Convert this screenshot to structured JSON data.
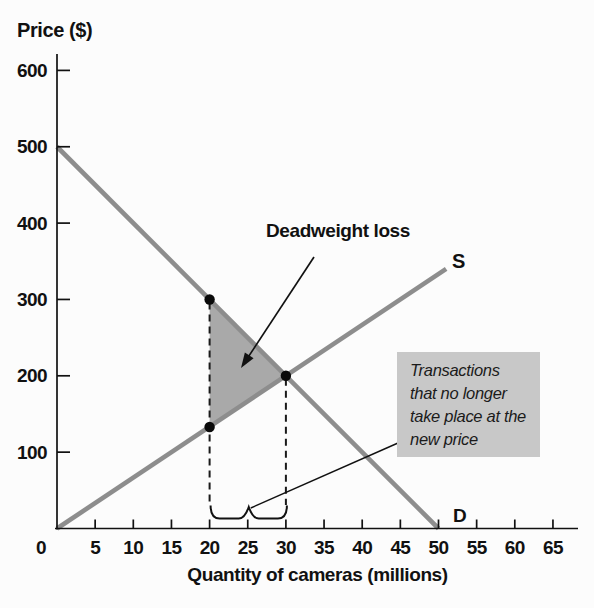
{
  "figure": {
    "background": "#fcfcfc"
  },
  "chart_data": {
    "type": "line",
    "title": "",
    "xlabel": "Quantity of cameras (millions)",
    "ylabel": "Price ($)",
    "xlim": [
      0,
      68
    ],
    "ylim": [
      0,
      630
    ],
    "x_ticks": [
      0,
      5,
      10,
      15,
      20,
      25,
      30,
      35,
      40,
      45,
      50,
      55,
      60,
      65
    ],
    "y_ticks": [
      100,
      200,
      300,
      400,
      500,
      600
    ],
    "grid": false,
    "legend_position": "inline-curve-labels",
    "axis_color": "#111111",
    "curve_color": "#8d8d8d",
    "series": [
      {
        "name": "demand",
        "label": "D",
        "points": [
          [
            0,
            500
          ],
          [
            50,
            0
          ]
        ]
      },
      {
        "name": "supply",
        "label": "S",
        "points": [
          [
            0,
            0
          ],
          [
            51,
            340
          ]
        ]
      }
    ],
    "equilibrium_point": {
      "x": 30,
      "y": 200
    },
    "marked_points": [
      {
        "x": 20,
        "y": 300
      },
      {
        "x": 20,
        "y": 133
      },
      {
        "x": 30,
        "y": 200
      }
    ],
    "dashed_drop_lines": [
      {
        "x": 20,
        "from_y": 300
      },
      {
        "x": 30,
        "from_y": 200
      }
    ],
    "deadweight_area": {
      "vertices": [
        [
          20,
          300
        ],
        [
          30,
          200
        ],
        [
          20,
          133
        ]
      ],
      "fill": "#a9a9a9"
    },
    "brace_span": {
      "from_x": 20,
      "to_x": 30
    },
    "annotations": {
      "deadweight_label": "Deadweight loss",
      "callout": {
        "lines": [
          "Transactions",
          "that no longer",
          "take place at the",
          "new price"
        ],
        "background": "#c8c8c8"
      }
    }
  }
}
